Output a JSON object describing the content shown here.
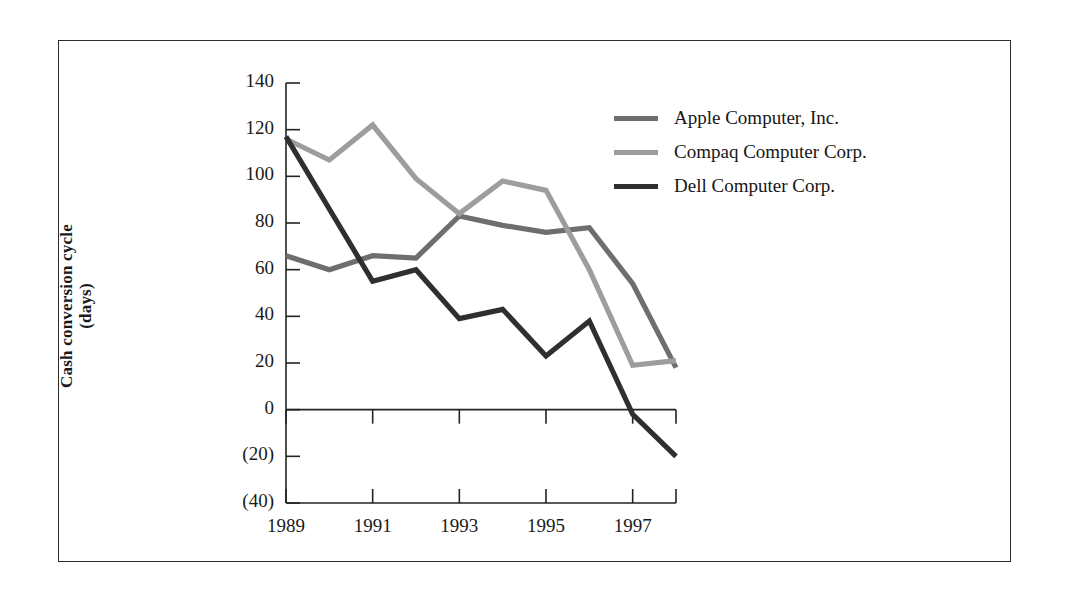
{
  "figure": {
    "frame_color": "#2b2b2b",
    "background": "#ffffff"
  },
  "axes": {
    "y_title_line1": "Cash conversion cycle",
    "y_title_line2": "(days)",
    "y_ticks": [
      "140",
      "120",
      "100",
      "80",
      "60",
      "40",
      "20",
      "0",
      "(20)",
      "(40)"
    ],
    "y_tick_values": [
      140,
      120,
      100,
      80,
      60,
      40,
      20,
      0,
      -20,
      -40
    ],
    "x_ticks": [
      "1989",
      "1991",
      "1993",
      "1995",
      "1997"
    ],
    "x_tick_values": [
      1989,
      1991,
      1993,
      1995,
      1997
    ]
  },
  "legend": {
    "items": [
      {
        "label": "Apple Computer, Inc.",
        "color": "#6e6e6e"
      },
      {
        "label": "Compaq Computer Corp.",
        "color": "#9d9d9d"
      },
      {
        "label": "Dell Computer Corp.",
        "color": "#2f2f2f"
      }
    ]
  },
  "chart_data": {
    "type": "line",
    "title": "",
    "subtitle": "",
    "xlabel": "",
    "ylabel": "Cash conversion cycle (days)",
    "x": [
      1989,
      1990,
      1991,
      1992,
      1993,
      1994,
      1995,
      1996,
      1997,
      1998
    ],
    "xlim": [
      1989,
      1998
    ],
    "ylim": [
      -40,
      140
    ],
    "ytick_step": 20,
    "xtick_step": 2,
    "grid": false,
    "legend_position": "upper-right-inside",
    "zero_line": true,
    "series": [
      {
        "name": "Apple Computer, Inc.",
        "color": "#6e6e6e",
        "values": [
          66,
          60,
          66,
          65,
          83,
          79,
          76,
          78,
          54,
          18
        ]
      },
      {
        "name": "Compaq Computer Corp.",
        "color": "#9d9d9d",
        "values": [
          116,
          107,
          122,
          99,
          84,
          98,
          94,
          60,
          19,
          21
        ]
      },
      {
        "name": "Dell Computer Corp.",
        "color": "#2f2f2f",
        "values": [
          117,
          86,
          55,
          60,
          39,
          43,
          23,
          38,
          -2,
          -20
        ]
      }
    ]
  }
}
